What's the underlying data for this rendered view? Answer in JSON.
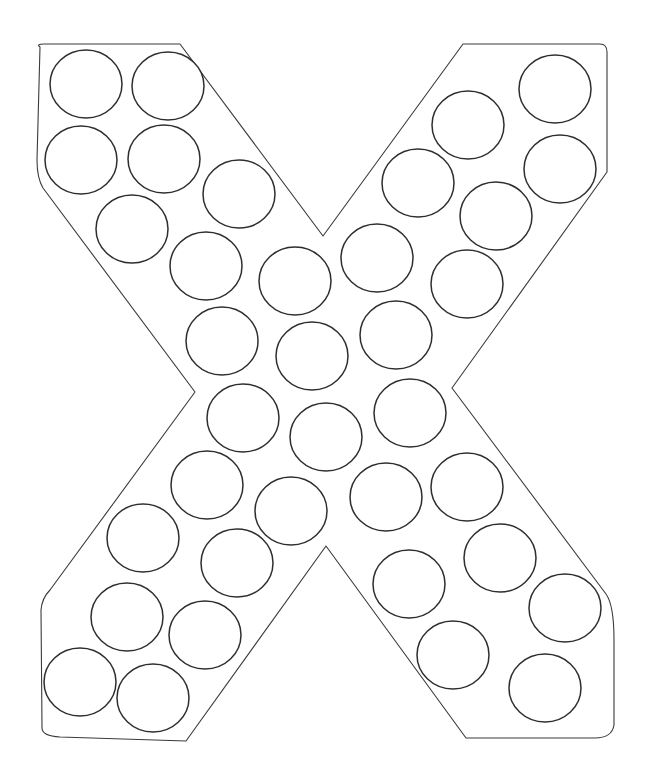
{
  "worksheet": {
    "letter": "X",
    "stroke_color": "#3a3a3a",
    "dot_stroke_color": "#2e2e2e",
    "background": "#ffffff",
    "outline_path": "M 40 47 Q 36 44 44 44 L 180 44 L 323 236 L 463 44 L 600 44 Q 607 44 607 52 L 607 172 L 452 388 L 606 594 Q 614 605 614 640 L 614 725 Q 612 738 595 738 L 466 738 L 326 546 L 186 741 L 60 737 Q 42 736 42 728 L 41 610 Q 42 598 50 590 L 195 392 L 43 188 Q 37 178 37 160 Z",
    "dot_radius_x": 36,
    "dot_radius_y": 34,
    "dots": [
      {
        "cx": 86,
        "cy": 84
      },
      {
        "cx": 168,
        "cy": 86
      },
      {
        "cx": 81,
        "cy": 160
      },
      {
        "cx": 164,
        "cy": 159
      },
      {
        "cx": 239,
        "cy": 194
      },
      {
        "cx": 132,
        "cy": 229
      },
      {
        "cx": 555,
        "cy": 89
      },
      {
        "cx": 468,
        "cy": 125
      },
      {
        "cx": 560,
        "cy": 169
      },
      {
        "cx": 418,
        "cy": 183
      },
      {
        "cx": 496,
        "cy": 216
      },
      {
        "cx": 377,
        "cy": 258
      },
      {
        "cx": 467,
        "cy": 284
      },
      {
        "cx": 206,
        "cy": 266
      },
      {
        "cx": 295,
        "cy": 281
      },
      {
        "cx": 222,
        "cy": 341
      },
      {
        "cx": 312,
        "cy": 356
      },
      {
        "cx": 396,
        "cy": 335
      },
      {
        "cx": 243,
        "cy": 418
      },
      {
        "cx": 326,
        "cy": 437
      },
      {
        "cx": 410,
        "cy": 413
      },
      {
        "cx": 207,
        "cy": 485
      },
      {
        "cx": 291,
        "cy": 511
      },
      {
        "cx": 386,
        "cy": 497
      },
      {
        "cx": 467,
        "cy": 487
      },
      {
        "cx": 143,
        "cy": 538
      },
      {
        "cx": 237,
        "cy": 563
      },
      {
        "cx": 409,
        "cy": 584
      },
      {
        "cx": 500,
        "cy": 558
      },
      {
        "cx": 127,
        "cy": 617
      },
      {
        "cx": 205,
        "cy": 635
      },
      {
        "cx": 565,
        "cy": 608
      },
      {
        "cx": 453,
        "cy": 655
      },
      {
        "cx": 80,
        "cy": 682
      },
      {
        "cx": 153,
        "cy": 698
      },
      {
        "cx": 545,
        "cy": 688
      }
    ]
  }
}
